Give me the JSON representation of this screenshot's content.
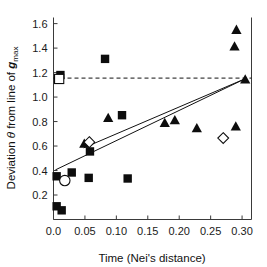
{
  "chart_data": {
    "type": "scatter",
    "title": "",
    "xlabel": "Time (Nei's distance)",
    "ylabel": "Deviation θ from line of gmax",
    "ylabel_parts": {
      "prefix": "Deviation ",
      "theta": "θ",
      "middle": " from line of ",
      "bold_italic": "g",
      "subscript": "max"
    },
    "xlim": [
      0.0,
      0.315
    ],
    "ylim": [
      0.0,
      1.65
    ],
    "xticks": [
      0.0,
      0.05,
      0.1,
      0.15,
      0.2,
      0.25,
      0.3
    ],
    "xtick_labels": [
      "0.0",
      "0.05",
      "0.10",
      "0.15",
      "0.20",
      "0.25",
      "0.30"
    ],
    "yticks": [
      0.2,
      0.4,
      0.6,
      0.8,
      1.0,
      1.2,
      1.4,
      1.6
    ],
    "ytick_labels": [
      "0.2",
      "0.4",
      "0.6",
      "0.8",
      "1.0",
      "1.2",
      "1.4",
      "1.6"
    ],
    "grid": false,
    "legend": "none",
    "series": [
      {
        "name": "filled-square",
        "marker": "square",
        "fill": "#0d0d0d",
        "points": [
          {
            "x": 0.011,
            "y": 1.18
          },
          {
            "x": 0.082,
            "y": 1.312
          },
          {
            "x": 0.109,
            "y": 0.852
          },
          {
            "x": 0.058,
            "y": 0.556
          },
          {
            "x": 0.005,
            "y": 0.353
          },
          {
            "x": 0.029,
            "y": 0.384
          },
          {
            "x": 0.056,
            "y": 0.34
          },
          {
            "x": 0.118,
            "y": 0.335
          },
          {
            "x": 0.005,
            "y": 0.108
          },
          {
            "x": 0.013,
            "y": 0.075
          }
        ]
      },
      {
        "name": "filled-triangle",
        "marker": "triangle",
        "fill": "#0d0d0d",
        "points": [
          {
            "x": 0.291,
            "y": 1.548
          },
          {
            "x": 0.288,
            "y": 1.412
          },
          {
            "x": 0.305,
            "y": 1.142
          },
          {
            "x": 0.087,
            "y": 0.828
          },
          {
            "x": 0.177,
            "y": 0.787
          },
          {
            "x": 0.193,
            "y": 0.81
          },
          {
            "x": 0.228,
            "y": 0.744
          },
          {
            "x": 0.29,
            "y": 0.758
          },
          {
            "x": 0.049,
            "y": 0.618
          }
        ]
      },
      {
        "name": "open-square",
        "marker": "square",
        "fill": "#ffffff",
        "points": [
          {
            "x": 0.009,
            "y": 1.148
          }
        ]
      },
      {
        "name": "open-circle",
        "marker": "circle",
        "fill": "#ffffff",
        "points": [
          {
            "x": 0.018,
            "y": 0.318
          }
        ]
      },
      {
        "name": "open-diamond",
        "marker": "diamond",
        "fill": "#ffffff",
        "points": [
          {
            "x": 0.057,
            "y": 0.632
          },
          {
            "x": 0.27,
            "y": 0.665
          }
        ]
      }
    ],
    "reference_line": {
      "name": "horizontal-dashed-reference",
      "style": "dashed",
      "y": 1.155,
      "x_start": 0.0,
      "x_end": 0.315
    },
    "trend_lines": [
      {
        "name": "regression-line-main",
        "style": "solid",
        "x_start": 0.003,
        "y_start": 0.405,
        "x_end": 0.305,
        "y_end": 1.15
      },
      {
        "name": "regression-line-secondary",
        "style": "solid",
        "x_start": 0.048,
        "y_start": 0.585,
        "x_end": 0.305,
        "y_end": 1.15
      }
    ]
  }
}
